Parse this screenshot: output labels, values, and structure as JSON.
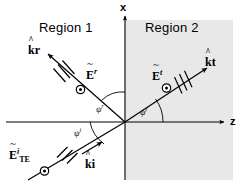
{
  "figure": {
    "background_color": "#ffffff",
    "line_color": "#000000",
    "region2_fill": "#e8e8e8"
  },
  "axes": {
    "x_axis_label": "x",
    "z_axis_label": "z",
    "origin_px": [
      125,
      122
    ]
  },
  "regions": [
    {
      "name": "region-1",
      "label": "Region 1",
      "shaded": false
    },
    {
      "name": "region-2",
      "label": "Region 2",
      "shaded": true
    }
  ],
  "waves": {
    "incident": {
      "k_symbol": "k",
      "k_superscript": "i",
      "e_symbol": "E",
      "e_superscript": "i",
      "e_subscript": "TE",
      "angle_symbol": "ψ",
      "angle_superscript": "i",
      "polarization_marker": "out-of-page-dot",
      "hash_marks": 3
    },
    "reflected": {
      "k_symbol": "k",
      "k_superscript": "r",
      "e_symbol": "E",
      "e_superscript": "r",
      "e_subscript": "",
      "angle_symbol": "ψ",
      "angle_superscript": "r",
      "polarization_marker": "out-of-page-dot",
      "hash_marks": 3
    },
    "transmitted": {
      "k_symbol": "k",
      "k_superscript": "t",
      "e_symbol": "E",
      "e_superscript": "t",
      "e_subscript": "",
      "angle_symbol": "ψ",
      "angle_superscript": "t",
      "polarization_marker": "out-of-page-dot",
      "hash_marks": 3
    }
  }
}
